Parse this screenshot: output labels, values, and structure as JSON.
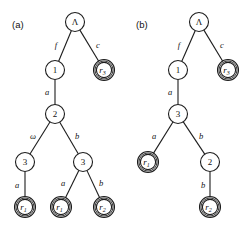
{
  "figure": {
    "panels": [
      {
        "id": "panel-a",
        "label": "(a)",
        "nodes": [
          {
            "id": "a-root",
            "label": "Λ",
            "style": "single",
            "italic": false,
            "x": 75,
            "y": 22
          },
          {
            "id": "a-n1",
            "label": "1",
            "style": "single",
            "italic": false,
            "x": 55,
            "y": 70
          },
          {
            "id": "a-r3",
            "label": "r",
            "sub": "3",
            "style": "double",
            "italic": true,
            "x": 104,
            "y": 70
          },
          {
            "id": "a-n2",
            "label": "2",
            "style": "single",
            "italic": false,
            "x": 55,
            "y": 114
          },
          {
            "id": "a-n3l",
            "label": "3",
            "style": "single",
            "italic": false,
            "x": 25,
            "y": 162
          },
          {
            "id": "a-n3r",
            "label": "3",
            "style": "single",
            "italic": false,
            "x": 83,
            "y": 162
          },
          {
            "id": "a-r1a",
            "label": "r",
            "sub": "1",
            "style": "double",
            "italic": true,
            "x": 25,
            "y": 207
          },
          {
            "id": "a-r1b",
            "label": "r",
            "sub": "1",
            "style": "double",
            "italic": true,
            "x": 61,
            "y": 207
          },
          {
            "id": "a-r2",
            "label": "r",
            "sub": "2",
            "style": "double",
            "italic": true,
            "x": 104,
            "y": 207
          }
        ],
        "edges": [
          {
            "from": "a-root",
            "to": "a-n1",
            "label": "f",
            "lx": 56,
            "ly": 45
          },
          {
            "from": "a-root",
            "to": "a-r3",
            "label": "c",
            "lx": 98,
            "ly": 45
          },
          {
            "from": "a-n1",
            "to": "a-n2",
            "label": "a",
            "lx": 47,
            "ly": 92
          },
          {
            "from": "a-n2",
            "to": "a-n3l",
            "label": "ω",
            "lx": 33,
            "ly": 136
          },
          {
            "from": "a-n2",
            "to": "a-n3r",
            "label": "b",
            "lx": 77,
            "ly": 136
          },
          {
            "from": "a-n3l",
            "to": "a-r1a",
            "label": "a",
            "lx": 17,
            "ly": 185
          },
          {
            "from": "a-n3r",
            "to": "a-r1b",
            "label": "a",
            "lx": 63,
            "ly": 183
          },
          {
            "from": "a-n3r",
            "to": "a-r2",
            "label": "b",
            "lx": 101,
            "ly": 183
          }
        ]
      },
      {
        "id": "panel-b",
        "label": "(b)",
        "nodes": [
          {
            "id": "b-root",
            "label": "Λ",
            "style": "single",
            "italic": false,
            "x": 199,
            "y": 22
          },
          {
            "id": "b-n1",
            "label": "1",
            "style": "single",
            "italic": false,
            "x": 178,
            "y": 70
          },
          {
            "id": "b-r3",
            "label": "r",
            "sub": "3",
            "style": "double",
            "italic": true,
            "x": 228,
            "y": 70
          },
          {
            "id": "b-n3",
            "label": "3",
            "style": "single",
            "italic": false,
            "x": 178,
            "y": 114
          },
          {
            "id": "b-r1",
            "label": "r",
            "sub": "1",
            "style": "double",
            "italic": true,
            "x": 148,
            "y": 162
          },
          {
            "id": "b-n2",
            "label": "2",
            "style": "single",
            "italic": false,
            "x": 210,
            "y": 162
          },
          {
            "id": "b-r2",
            "label": "r",
            "sub": "2",
            "style": "double",
            "italic": true,
            "x": 210,
            "y": 207
          }
        ],
        "edges": [
          {
            "from": "b-root",
            "to": "b-n1",
            "label": "f",
            "lx": 179,
            "ly": 45
          },
          {
            "from": "b-root",
            "to": "b-r3",
            "label": "c",
            "lx": 222,
            "ly": 45
          },
          {
            "from": "b-n1",
            "to": "b-n3",
            "label": "a",
            "lx": 170,
            "ly": 92
          },
          {
            "from": "b-n3",
            "to": "b-r1",
            "label": "a",
            "lx": 154,
            "ly": 136
          },
          {
            "from": "b-n3",
            "to": "b-n2",
            "label": "b",
            "lx": 201,
            "ly": 136
          },
          {
            "from": "b-n2",
            "to": "b-r2",
            "label": "b",
            "lx": 203,
            "ly": 185
          }
        ]
      }
    ],
    "geometry": {
      "node_radius": 9.5,
      "double_outer_radius": 10.5,
      "double_inner_radius": 7.6,
      "panel_label_a": {
        "x": 12,
        "y": 28
      },
      "panel_label_b": {
        "x": 136,
        "y": 28
      }
    },
    "colors": {
      "stroke": "#1c1c1c",
      "node_fill": "#ffffff",
      "text": "#111111",
      "background": "#ffffff"
    }
  }
}
